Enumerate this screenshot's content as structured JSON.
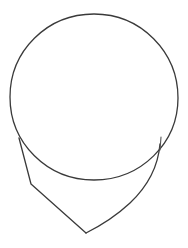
{
  "drawing": {
    "description": "Pencil sketch of a head construction: cranium circle with jaw outline",
    "stroke_color": "#3a3a3a",
    "background_color": "#ffffff",
    "cranium_circle": {
      "cx": 94,
      "cy": 97,
      "r": 84
    },
    "jaw": {
      "left_side": [
        [
          19,
          138
        ],
        [
          31,
          184
        ],
        [
          86,
          233
        ]
      ],
      "right_side": [
        [
          161,
          140
        ],
        [
          150,
          178
        ],
        [
          86,
          233
        ]
      ],
      "chin_point": [
        86,
        233
      ],
      "right_overshoot_tick": [
        [
          161,
          137
        ],
        [
          159,
          152
        ]
      ]
    }
  }
}
